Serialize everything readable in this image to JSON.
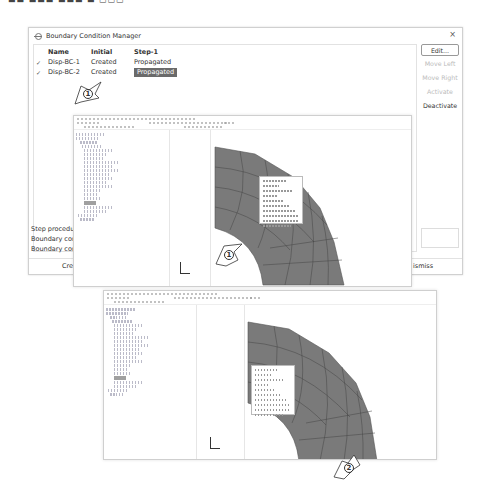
{
  "dialog": {
    "title": "Boundary Condition Manager",
    "close_label": "×",
    "columns": [
      "Name",
      "Initial",
      "Step-1"
    ],
    "rows": [
      {
        "check": "✓",
        "name": "Disp-BC-1",
        "initial": "Created",
        "step1": "Propagated",
        "selected": false
      },
      {
        "check": "✓",
        "name": "Disp-BC-2",
        "initial": "Created",
        "step1": "Propagated",
        "selected": true
      }
    ],
    "buttons": {
      "edit": "Edit...",
      "move_left": "Move Left",
      "move_right": "Move Right",
      "activate": "Activate",
      "deactivate": "Deactivate"
    },
    "status": {
      "line1": "Step procedure",
      "line2": "Boundary conditi",
      "line3": "Boundary conditi"
    },
    "footer": {
      "create": "Create",
      "dismiss": "ismiss"
    }
  },
  "callouts": {
    "c1_top": "1",
    "c1_shot": "1",
    "c2_shot": "2"
  },
  "colors": {
    "selection": "#6a6a6a",
    "mesh": "#7a7a7a",
    "mesh_lines": "#4a4a4a"
  }
}
